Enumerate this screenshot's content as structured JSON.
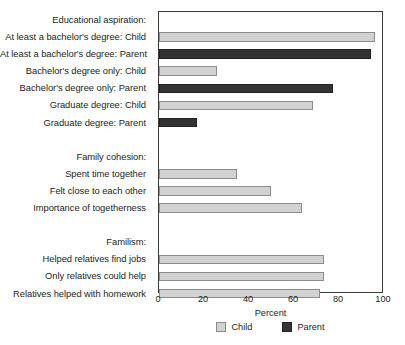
{
  "chart_data": {
    "type": "bar",
    "orientation": "horizontal",
    "title": "",
    "xlabel": "Percent",
    "ylabel": "",
    "xlim": [
      0,
      100
    ],
    "xticks": [
      0,
      20,
      40,
      60,
      80,
      100
    ],
    "xticklabels": [
      "0",
      "20",
      "40",
      "60",
      "80",
      "100"
    ],
    "grid": false,
    "legend_position": "bottom-center",
    "legend": [
      {
        "name": "Child",
        "color": "#d2d2d2"
      },
      {
        "name": "Parent",
        "color": "#333333"
      }
    ],
    "group_headers": [
      "Educational aspiration:",
      "Family cohesion:",
      "Familism:"
    ],
    "categories": [
      "Educational aspiration:",
      "At least a bachelor's degree: Child",
      "At least a bachelor's degree: Parent",
      "Bachelor's degree only: Child",
      "Bachelor's degree only: Parent",
      "Graduate degree: Child",
      "Graduate degree: Parent",
      "",
      "Family cohesion:",
      "Spent time together",
      "Felt close to each other",
      "Importance of togetherness",
      "",
      "Familism:",
      "Helped relatives find jobs",
      "Only relatives could help",
      "Relatives helped with homework"
    ],
    "rows": [
      {
        "label": "Educational aspiration:",
        "kind": "header",
        "series": null,
        "value": null
      },
      {
        "label": "At least a bachelor's degree: Child",
        "kind": "bar",
        "series": "Child",
        "value": 97
      },
      {
        "label": "At least a bachelor's degree: Parent",
        "kind": "bar",
        "series": "Parent",
        "value": 95
      },
      {
        "label": "Bachelor's degree only: Child",
        "kind": "bar",
        "series": "Child",
        "value": 26
      },
      {
        "label": "Bachelor's degree only: Parent",
        "kind": "bar",
        "series": "Parent",
        "value": 78
      },
      {
        "label": "Graduate degree: Child",
        "kind": "bar",
        "series": "Child",
        "value": 69
      },
      {
        "label": "Graduate degree: Parent",
        "kind": "bar",
        "series": "Parent",
        "value": 17
      },
      {
        "label": "",
        "kind": "spacer",
        "series": null,
        "value": null
      },
      {
        "label": "Family cohesion:",
        "kind": "header",
        "series": null,
        "value": null
      },
      {
        "label": "Spent time together",
        "kind": "bar",
        "series": "Child",
        "value": 35
      },
      {
        "label": "Felt close to each other",
        "kind": "bar",
        "series": "Child",
        "value": 50
      },
      {
        "label": "Importance of togetherness",
        "kind": "bar",
        "series": "Child",
        "value": 64
      },
      {
        "label": "",
        "kind": "spacer",
        "series": null,
        "value": null
      },
      {
        "label": "Familism:",
        "kind": "header",
        "series": null,
        "value": null
      },
      {
        "label": "Helped relatives find jobs",
        "kind": "bar",
        "series": "Child",
        "value": 74
      },
      {
        "label": "Only relatives could help",
        "kind": "bar",
        "series": "Child",
        "value": 74
      },
      {
        "label": "Relatives helped with homework",
        "kind": "bar",
        "series": "Child",
        "value": 72
      }
    ]
  }
}
